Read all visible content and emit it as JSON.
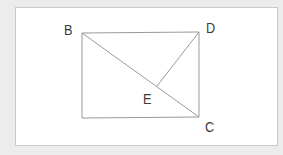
{
  "diagram": {
    "type": "geometry-figure",
    "shape": "rectangle",
    "points": {
      "B": {
        "label": "B",
        "x": 82,
        "y": 33
      },
      "D": {
        "label": "D",
        "x": 199,
        "y": 32
      },
      "C": {
        "label": "C",
        "x": 199,
        "y": 117
      },
      "A_unlabeled": {
        "x": 82,
        "y": 118
      },
      "E": {
        "label": "E",
        "x": 157,
        "y": 86
      }
    },
    "segments": [
      "BD",
      "DC",
      "C-A",
      "A-B",
      "BC",
      "DE"
    ],
    "labels": {
      "B": "B",
      "D": "D",
      "E": "E",
      "C": "C"
    },
    "colors": {
      "background": "#ececec",
      "panel": "#ffffff",
      "panel_border": "#c9c9c9",
      "line": "#9a9a9a",
      "text": "#3a3a3a"
    }
  }
}
